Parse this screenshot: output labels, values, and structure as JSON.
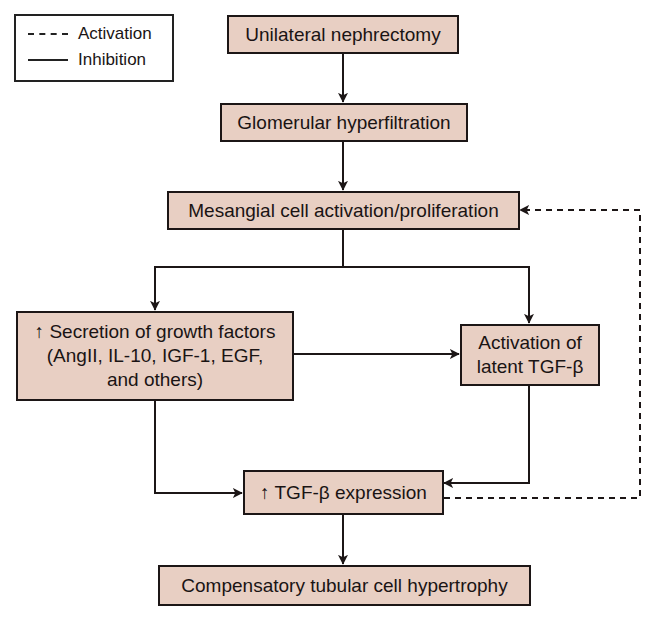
{
  "legend": {
    "items": [
      {
        "label": "Activation",
        "line_style": "dashed"
      },
      {
        "label": "Inhibition",
        "line_style": "solid"
      }
    ]
  },
  "nodes": {
    "n1": {
      "lines": [
        "Unilateral nephrectomy"
      ]
    },
    "n2": {
      "lines": [
        "Glomerular hyperfiltration"
      ]
    },
    "n3": {
      "lines": [
        "Mesangial cell activation/proliferation"
      ]
    },
    "n4": {
      "lines": [
        "↑ Secretion of growth factors",
        "(AngII, IL-10, IGF-1, EGF,",
        "and others)"
      ]
    },
    "n5": {
      "lines": [
        "Activation of",
        "latent TGF-β"
      ]
    },
    "n6": {
      "lines": [
        "↑ TGF-β expression"
      ]
    },
    "n7": {
      "lines": [
        "Compensatory tubular cell hypertrophy"
      ]
    }
  },
  "edges": [
    {
      "from": "n1",
      "to": "n2",
      "style": "solid"
    },
    {
      "from": "n2",
      "to": "n3",
      "style": "solid"
    },
    {
      "from": "n3",
      "to": "n4",
      "style": "solid"
    },
    {
      "from": "n3",
      "to": "n5",
      "style": "solid"
    },
    {
      "from": "n4",
      "to": "n5",
      "style": "solid"
    },
    {
      "from": "n4",
      "to": "n6",
      "style": "solid"
    },
    {
      "from": "n5",
      "to": "n6",
      "style": "solid"
    },
    {
      "from": "n6",
      "to": "n3",
      "style": "dashed"
    },
    {
      "from": "n6",
      "to": "n7",
      "style": "solid"
    }
  ],
  "colors": {
    "box_fill": "#e8cfc3",
    "line": "#1c1616"
  }
}
